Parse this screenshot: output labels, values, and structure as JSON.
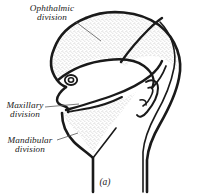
{
  "figure": {
    "caption": "(a)",
    "background_color": "#ffffff",
    "ink_color": "#1a1a1a",
    "stipple_color": "#7a7a7a"
  },
  "labels": {
    "ophthalmic": {
      "line1": "Ophthalmic",
      "line2": "division"
    },
    "maxillary": {
      "line1": "Maxillary",
      "line2": "division"
    },
    "mandibular": {
      "line1": "Mandibular",
      "line2": "division"
    }
  },
  "regions": [
    {
      "name": "ophthalmic-region",
      "shading": "stippled"
    },
    {
      "name": "maxillary-region",
      "shading": "blank"
    },
    {
      "name": "mandibular-region",
      "shading": "stippled"
    }
  ],
  "features": [
    {
      "name": "eye"
    },
    {
      "name": "ear"
    },
    {
      "name": "nose"
    },
    {
      "name": "lips"
    },
    {
      "name": "jaw"
    },
    {
      "name": "neck"
    }
  ]
}
